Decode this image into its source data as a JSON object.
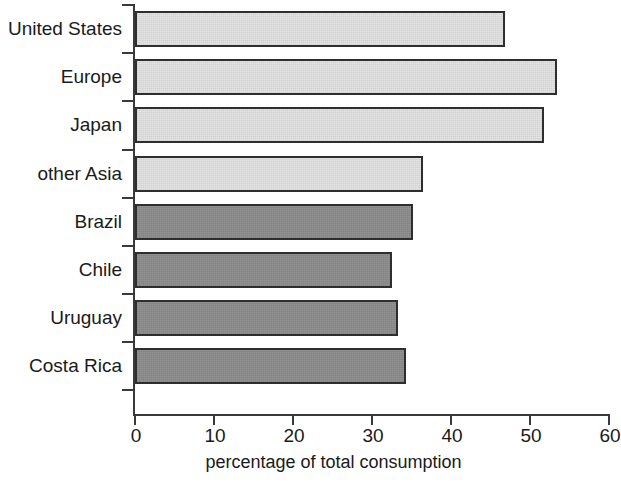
{
  "chart_data": {
    "type": "bar",
    "orientation": "horizontal",
    "title": "",
    "subtitle": "",
    "xlabel": "percentage of total consumption",
    "ylabel": "",
    "xlim": [
      0,
      60
    ],
    "xticks": [
      0,
      10,
      20,
      30,
      40,
      50,
      60
    ],
    "xtick_labels": [
      "0",
      "10",
      "20",
      "30",
      "40",
      "50",
      "60"
    ],
    "grid": false,
    "legend": false,
    "categories": [
      "United States",
      "Europe",
      "Japan",
      "other Asia",
      "Brazil",
      "Chile",
      "Uruguay",
      "Costa Rica"
    ],
    "values": [
      46.8,
      53.4,
      51.8,
      36.5,
      35.2,
      32.5,
      33.3,
      34.3
    ],
    "bar_styles": [
      "light",
      "light",
      "light",
      "light",
      "dark",
      "dark",
      "dark",
      "dark"
    ],
    "colors": {
      "light_bar_fill": "#e2e2e2",
      "dark_bar_fill": "#8c8c8c",
      "bar_outline": "#2e2e2e",
      "axis": "#3a3a3a",
      "text": "#1a1a1a",
      "background": "#ffffff"
    }
  }
}
